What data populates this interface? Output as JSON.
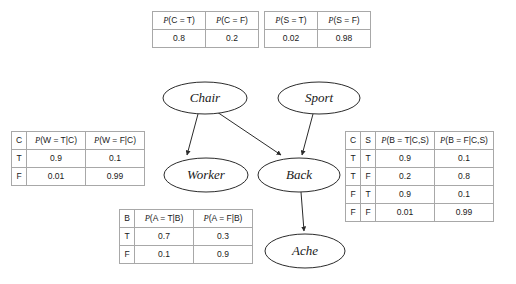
{
  "diagram": {
    "type": "bayesian-network",
    "title": "",
    "nodes": [
      {
        "id": "chair",
        "label": "Chair",
        "cx": 205,
        "cy": 98,
        "rx": 42,
        "ry": 16
      },
      {
        "id": "sport",
        "label": "Sport",
        "cx": 319,
        "cy": 98,
        "rx": 41,
        "ry": 16
      },
      {
        "id": "worker",
        "label": "Worker",
        "cx": 206,
        "cy": 175,
        "rx": 42,
        "ry": 17
      },
      {
        "id": "back",
        "label": "Back",
        "cx": 299,
        "cy": 175,
        "rx": 41,
        "ry": 17
      },
      {
        "id": "ache",
        "label": "Ache",
        "cx": 305,
        "cy": 251,
        "rx": 40,
        "ry": 17
      }
    ],
    "edges": [
      {
        "from": "chair",
        "to": "worker"
      },
      {
        "from": "chair",
        "to": "back"
      },
      {
        "from": "sport",
        "to": "back"
      },
      {
        "from": "back",
        "to": "ache"
      }
    ],
    "colors": {
      "stroke": "#2b2b2b",
      "table_border": "#a8a8a8",
      "background": "#ffffff",
      "text": "#1a1a1a"
    }
  },
  "tables": {
    "chair": {
      "name": "chair-cpt",
      "headers": [
        "P(C = T)",
        "P(C = F)"
      ],
      "header_parts": [
        {
          "p": "P",
          "rest": "(C = T)"
        },
        {
          "p": "P",
          "rest": "(C = F)"
        }
      ],
      "rows": [
        [
          "0.8",
          "0.2"
        ]
      ]
    },
    "sport": {
      "name": "sport-cpt",
      "headers": [
        "P(S = T)",
        "P(S = F)"
      ],
      "header_parts": [
        {
          "p": "P",
          "rest": "(S = T)"
        },
        {
          "p": "P",
          "rest": "(S = F)"
        }
      ],
      "rows": [
        [
          "0.02",
          "0.98"
        ]
      ]
    },
    "worker": {
      "name": "worker-cpt",
      "headers": [
        "C",
        "P(W = T|C)",
        "P(W = F|C)"
      ],
      "header_parts": [
        {
          "p": "",
          "rest": "C"
        },
        {
          "p": "P",
          "rest": "(W = T|C)"
        },
        {
          "p": "P",
          "rest": "(W = F|C)"
        }
      ],
      "rows": [
        [
          "T",
          "0.9",
          "0.1"
        ],
        [
          "F",
          "0.01",
          "0.99"
        ]
      ]
    },
    "back": {
      "name": "back-cpt",
      "headers": [
        "C",
        "S",
        "P(B = T|C,S)",
        "P(B = F|C,S)"
      ],
      "header_parts": [
        {
          "p": "",
          "rest": "C"
        },
        {
          "p": "",
          "rest": "S"
        },
        {
          "p": "P",
          "rest": "(B = T|C,S)"
        },
        {
          "p": "P",
          "rest": "(B = F|C,S)"
        }
      ],
      "rows": [
        [
          "T",
          "T",
          "0.9",
          "0.1"
        ],
        [
          "T",
          "F",
          "0.2",
          "0.8"
        ],
        [
          "F",
          "T",
          "0.9",
          "0.1"
        ],
        [
          "F",
          "F",
          "0.01",
          "0.99"
        ]
      ]
    },
    "ache": {
      "name": "ache-cpt",
      "headers": [
        "B",
        "P(A = T|B)",
        "P(A = F|B)"
      ],
      "header_parts": [
        {
          "p": "",
          "rest": "B"
        },
        {
          "p": "P",
          "rest": "(A = T|B)"
        },
        {
          "p": "P",
          "rest": "(A = F|B)"
        }
      ],
      "rows": [
        [
          "T",
          "0.7",
          "0.3"
        ],
        [
          "F",
          "0.1",
          "0.9"
        ]
      ]
    }
  }
}
